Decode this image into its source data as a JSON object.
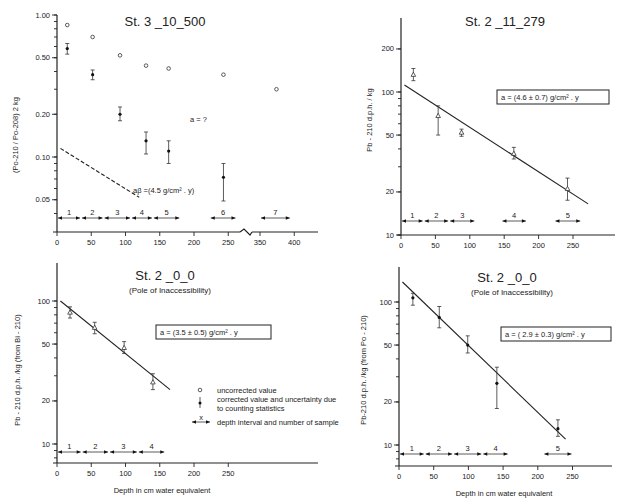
{
  "chart_data": [
    {
      "type": "scatter",
      "title": "St. 3 _10_500",
      "subtitle": "",
      "ylabel": "(Po-210 / Po-208)  2 kg",
      "xlabel": "",
      "yscale": "log",
      "ylim": [
        0.035,
        1.0
      ],
      "xlim": [
        0,
        430
      ],
      "x_break": [
        265,
        335
      ],
      "yticks": [
        1.0,
        0.5,
        0.2,
        0.1,
        0.05
      ],
      "ytick_labels": [
        "1.00",
        "0.50",
        "0.20",
        "0.10",
        "0.05"
      ],
      "xticks": [
        0,
        50,
        100,
        150,
        200,
        250,
        350,
        400
      ],
      "xtick_labels": [
        "0",
        "50",
        "100",
        "150",
        "200",
        "250",
        "350",
        "400"
      ],
      "series": [
        {
          "name": "uncorrected value",
          "marker": "open-circle",
          "x": [
            15,
            52,
            92,
            130,
            163,
            243,
            374
          ],
          "y": [
            0.85,
            0.7,
            0.52,
            0.44,
            0.42,
            0.38,
            0.3
          ]
        },
        {
          "name": "corrected value",
          "marker": "dot-errorbar",
          "x": [
            15,
            52,
            92,
            130,
            163,
            243
          ],
          "y": [
            0.58,
            0.38,
            0.2,
            0.13,
            0.11,
            0.072
          ],
          "err_low": [
            0.05,
            0.03,
            0.02,
            0.025,
            0.02,
            0.023
          ],
          "err_high": [
            0.05,
            0.03,
            0.025,
            0.02,
            0.02,
            0.018
          ]
        }
      ],
      "reference_line": {
        "style": "dashed",
        "x": [
          5,
          120
        ],
        "y": [
          0.115,
          0.052
        ],
        "label": "aβ =(4.5 g/cm² . y)"
      },
      "annotation": "a = ?",
      "depth_intervals": [
        {
          "n": "1",
          "x0": 0,
          "x1": 35
        },
        {
          "n": "2",
          "x0": 35,
          "x1": 68
        },
        {
          "n": "3",
          "x0": 68,
          "x1": 108
        },
        {
          "n": "4",
          "x0": 108,
          "x1": 140
        },
        {
          "n": "5",
          "x0": 140,
          "x1": 180
        },
        {
          "n": "6",
          "x0": 223,
          "x1": 262
        },
        {
          "n": "7",
          "x0": 350,
          "x1": 395
        }
      ]
    },
    {
      "type": "scatter",
      "title": "St. 2 _11_279",
      "subtitle": "",
      "ylabel": "Pb - 210   d.p.h. / kg",
      "xlabel": "",
      "yscale": "log",
      "ylim": [
        10,
        280
      ],
      "xlim": [
        0,
        310
      ],
      "yticks": [
        200,
        100,
        50,
        20,
        10
      ],
      "ytick_labels": [
        "200",
        "100",
        "50",
        "20",
        "10"
      ],
      "xticks": [
        0,
        50,
        100,
        150,
        200,
        250
      ],
      "xtick_labels": [
        "0",
        "50",
        "100",
        "150",
        "200",
        "250"
      ],
      "series": [
        {
          "name": "Pb-210",
          "marker": "open-triangle",
          "x": [
            18,
            54,
            88,
            164,
            242
          ],
          "y": [
            132,
            68,
            52,
            37,
            21
          ],
          "err_low": [
            12,
            18,
            3,
            3,
            3.5
          ],
          "err_high": [
            14,
            12,
            3,
            4,
            4
          ]
        }
      ],
      "fit_line": {
        "x": [
          5,
          272
        ],
        "y": [
          112,
          16.5
        ]
      },
      "annotation": "a = (4.6 ± 0.7) g/cm² . y",
      "depth_intervals": [
        {
          "n": "1",
          "x0": 0,
          "x1": 33
        },
        {
          "n": "2",
          "x0": 33,
          "x1": 70
        },
        {
          "n": "3",
          "x0": 70,
          "x1": 108
        },
        {
          "n": "4",
          "x0": 146,
          "x1": 183
        },
        {
          "n": "5",
          "x0": 223,
          "x1": 262
        }
      ]
    },
    {
      "type": "scatter",
      "title": "St. 2 _0_0",
      "subtitle": "(Pole of Inaccessibility)",
      "ylabel": "Pb - 210   d.p.h. /kg  (from  Bi - 210)",
      "xlabel": "Depth  in  cm  water  equivalent",
      "yscale": "log",
      "ylim": [
        6.5,
        200
      ],
      "xlim": [
        0,
        380
      ],
      "yticks": [
        100,
        50,
        20,
        10
      ],
      "ytick_labels": [
        "100",
        "50",
        "20",
        "10"
      ],
      "xticks": [
        0,
        50,
        100,
        150,
        200,
        250
      ],
      "xtick_labels": [
        "0",
        "50",
        "100",
        "150",
        "200",
        "250"
      ],
      "series": [
        {
          "name": "Pb-210 (from Bi-210)",
          "marker": "open-triangle",
          "x": [
            19,
            55,
            98,
            140
          ],
          "y": [
            83,
            65,
            47,
            27
          ],
          "err_low": [
            7,
            6,
            4,
            3
          ],
          "err_high": [
            8,
            6,
            5,
            4
          ]
        }
      ],
      "fit_line": {
        "x": [
          5,
          165
        ],
        "y": [
          100,
          24
        ]
      },
      "annotation": "a = (3.5 ± 0.5)  g/cm² . y",
      "depth_intervals": [
        {
          "n": "1",
          "x0": 0,
          "x1": 36
        },
        {
          "n": "2",
          "x0": 36,
          "x1": 76
        },
        {
          "n": "3",
          "x0": 76,
          "x1": 118
        },
        {
          "n": "4",
          "x0": 118,
          "x1": 158
        }
      ]
    },
    {
      "type": "scatter",
      "title": "St. 2 _0_0",
      "subtitle": "(Pole of Inaccessibility)",
      "ylabel": "Pb-210   d.p.h. /kg  (from  Po - 210)",
      "xlabel": "Depth  in  cm  water  equivalent",
      "yscale": "log",
      "ylim": [
        6.5,
        200
      ],
      "xlim": [
        0,
        310
      ],
      "yticks": [
        100,
        50,
        20,
        10
      ],
      "ytick_labels": [
        "100",
        "50",
        "20",
        "10"
      ],
      "xticks": [
        0,
        50,
        100,
        150,
        200,
        250
      ],
      "xtick_labels": [
        "0",
        "50",
        "100",
        "150",
        "200",
        "250"
      ],
      "series": [
        {
          "name": "Pb-210 (from Po-210)",
          "marker": "dot-errorbar",
          "x": [
            20,
            58,
            99,
            141,
            229
          ],
          "y": [
            107,
            78,
            50,
            27,
            13
          ],
          "err_low": [
            12,
            12,
            6,
            9,
            1.5
          ],
          "err_high": [
            8,
            15,
            8,
            8,
            2
          ]
        }
      ],
      "fit_line": {
        "x": [
          5,
          240
        ],
        "y": [
          138,
          11
        ]
      },
      "annotation": "a = ( 2.9 ± 0.3)  g/cm² . y",
      "depth_intervals": [
        {
          "n": "1",
          "x0": 0,
          "x1": 37
        },
        {
          "n": "2",
          "x0": 37,
          "x1": 78
        },
        {
          "n": "3",
          "x0": 78,
          "x1": 120
        },
        {
          "n": "4",
          "x0": 120,
          "x1": 158
        },
        {
          "n": "5",
          "x0": 208,
          "x1": 250
        }
      ]
    }
  ],
  "legend": {
    "placement": "center",
    "items": [
      {
        "symbol": "open-circle",
        "label": "uncorrected value"
      },
      {
        "symbol": "dot-errorbar",
        "label": "corrected value and uncertainty due",
        "label2": "to counting statistics"
      },
      {
        "symbol": "interval-arrow",
        "symbol_text": "x",
        "label": "depth interval and number of sample"
      }
    ]
  }
}
